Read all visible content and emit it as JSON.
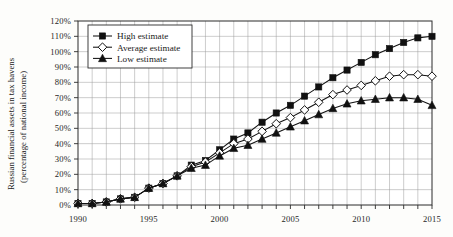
{
  "chart_data": {
    "type": "line",
    "title": "",
    "xlabel": "",
    "ylabel": "Russian financial assets in tax havens (percentage of national income)",
    "ylabel_line1": "Russian financial assets in tax havens",
    "ylabel_line2": "(percentage of national income)",
    "xlim": [
      1990,
      2015
    ],
    "ylim": [
      0,
      120
    ],
    "y_unit": "%",
    "grid": true,
    "legend_position": "top-left",
    "x": [
      1990,
      1991,
      1992,
      1993,
      1994,
      1995,
      1996,
      1997,
      1998,
      1999,
      2000,
      2001,
      2002,
      2003,
      2004,
      2005,
      2006,
      2007,
      2008,
      2009,
      2010,
      2011,
      2012,
      2013,
      2014,
      2015
    ],
    "xticks": [
      1990,
      1995,
      2000,
      2005,
      2010,
      2015
    ],
    "xtick_labels": [
      "1990",
      "1995",
      "2000",
      "2005",
      "2010",
      "2015"
    ],
    "yticks": [
      0,
      10,
      20,
      30,
      40,
      50,
      60,
      70,
      80,
      90,
      100,
      110,
      120
    ],
    "ytick_labels": [
      "0%",
      "10%",
      "20%",
      "30%",
      "40%",
      "50%",
      "60%",
      "70%",
      "80%",
      "90%",
      "100%",
      "110%",
      "120%"
    ],
    "series": [
      {
        "name": "High estimate",
        "marker": "filled-square",
        "values": [
          1,
          1,
          2,
          4,
          5,
          11,
          14,
          19,
          26,
          29,
          36,
          43,
          47,
          54,
          60,
          65,
          71,
          77,
          83,
          88,
          93,
          98,
          102,
          106,
          109,
          110
        ]
      },
      {
        "name": "Average estimate",
        "marker": "open-diamond",
        "values": [
          1,
          1,
          2,
          4,
          5,
          11,
          14,
          19,
          25,
          28,
          34,
          40,
          43,
          48,
          53,
          57,
          62,
          67,
          72,
          75,
          78,
          81,
          84,
          85,
          85,
          84
        ]
      },
      {
        "name": "Low estimate",
        "marker": "filled-triangle",
        "values": [
          1,
          1,
          2,
          4,
          5,
          11,
          14,
          19,
          24,
          26,
          32,
          37,
          39,
          43,
          47,
          51,
          55,
          59,
          63,
          66,
          68,
          69,
          70,
          70,
          69,
          65
        ]
      }
    ],
    "colors": {
      "line": "#111111",
      "grid": "#9a9a9a",
      "frame": "#2b2b2b",
      "background": "#fdfdfb",
      "text": "#1a1a1a"
    }
  },
  "legend": {
    "items": [
      {
        "label": "High estimate",
        "marker": "filled-square"
      },
      {
        "label": "Average estimate",
        "marker": "open-diamond"
      },
      {
        "label": "Low estimate",
        "marker": "filled-triangle"
      }
    ]
  }
}
